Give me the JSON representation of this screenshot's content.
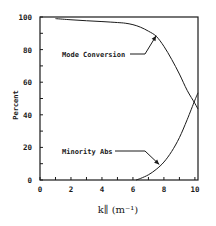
{
  "chart_data": {
    "type": "line",
    "title": "",
    "xlabel": "k∥ (m⁻¹)",
    "ylabel": "Percent",
    "xlim": [
      0,
      10.2
    ],
    "ylim": [
      0,
      100
    ],
    "x_ticks": [
      0,
      2,
      4,
      6,
      8,
      10
    ],
    "y_ticks": [
      0,
      20,
      40,
      60,
      80,
      100
    ],
    "x_minor_ticks": [
      1,
      3,
      5,
      7,
      9
    ],
    "y_minor_ticks": [
      10,
      30,
      50,
      70,
      90
    ],
    "grid": false,
    "legend": "none",
    "series": [
      {
        "name": "Mode Conversion",
        "x": [
          1.0,
          2.0,
          3.0,
          4.0,
          5.0,
          5.5,
          6.0,
          6.5,
          7.0,
          7.5,
          8.0,
          8.5,
          9.0,
          9.5,
          10.0,
          10.2
        ],
        "y": [
          99.0,
          98.3,
          97.7,
          97.2,
          96.6,
          96.2,
          95.3,
          93.7,
          91.3,
          88.2,
          82.0,
          74.0,
          65.0,
          55.0,
          47.0,
          43.5
        ]
      },
      {
        "name": "Minority Abs",
        "x": [
          6.2,
          6.5,
          7.0,
          7.5,
          8.0,
          8.5,
          9.0,
          9.5,
          10.0,
          10.2
        ],
        "y": [
          0.0,
          1.0,
          3.2,
          6.5,
          11.0,
          17.5,
          26.0,
          37.0,
          49.0,
          53.5
        ]
      }
    ],
    "annotations": [
      {
        "text": "Mode Conversion",
        "points_to_series": "Mode Conversion",
        "arrow_target": [
          7.5,
          88.5
        ]
      },
      {
        "text": "Minority Abs",
        "points_to_series": "Minority Abs",
        "arrow_target": [
          7.7,
          9.5
        ]
      }
    ]
  }
}
